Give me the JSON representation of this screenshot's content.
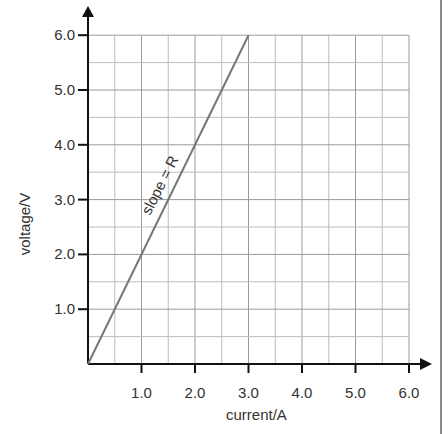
{
  "chart_data": {
    "type": "line",
    "title": "",
    "xlabel": "current/A",
    "ylabel": "voltage/V",
    "xlim": [
      0,
      6.0
    ],
    "ylim": [
      0,
      6.0
    ],
    "x_ticks": [
      "1.0",
      "2.0",
      "3.0",
      "4.0",
      "5.0",
      "6.0"
    ],
    "y_ticks": [
      "1.0",
      "2.0",
      "3.0",
      "4.0",
      "5.0",
      "6.0"
    ],
    "grid": true,
    "grid_minor_step": 0.5,
    "series": [
      {
        "name": "slope = R",
        "x": [
          0,
          3.0
        ],
        "y": [
          0,
          6.0
        ],
        "color": "#777777"
      }
    ],
    "annotations": [
      {
        "text": "slope = R",
        "x": 1.55,
        "y": 3.2,
        "rotation_deg": -63
      }
    ]
  },
  "labels": {
    "xlabel": "current/A",
    "ylabel": "voltage/V",
    "annotation": "slope = R",
    "x_ticks": [
      "1.0",
      "2.0",
      "3.0",
      "4.0",
      "5.0",
      "6.0"
    ],
    "y_ticks": [
      "1.0",
      "2.0",
      "3.0",
      "4.0",
      "5.0",
      "6.0"
    ]
  }
}
